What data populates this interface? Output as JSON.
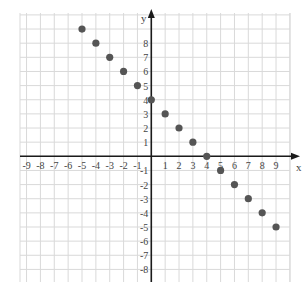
{
  "chart_data": {
    "type": "scatter",
    "title": "",
    "xlabel": "x",
    "ylabel": "y",
    "xlim": [
      -9,
      9
    ],
    "ylim": [
      -8,
      9
    ],
    "grid": true,
    "x_ticks": [
      -9,
      -8,
      -7,
      -6,
      -5,
      -4,
      -3,
      -2,
      -1,
      1,
      2,
      3,
      4,
      5,
      6,
      7,
      8,
      9
    ],
    "y_ticks": [
      -8,
      -7,
      -6,
      -5,
      -4,
      -3,
      -2,
      -1,
      1,
      2,
      3,
      4,
      5,
      6,
      7,
      8
    ],
    "series": [
      {
        "name": "points",
        "x": [
          -5,
          -4,
          -3,
          -2,
          -1,
          0,
          1,
          2,
          3,
          4,
          5,
          6,
          7,
          8,
          9
        ],
        "y": [
          9,
          8,
          7,
          6,
          5,
          4,
          3,
          2,
          1,
          0,
          -1,
          -2,
          -3,
          -4,
          -5
        ]
      }
    ]
  },
  "colors": {
    "grid": "#d9d9d9",
    "axis": "#1a1a1a",
    "point": "#555555",
    "label": "#444444"
  }
}
